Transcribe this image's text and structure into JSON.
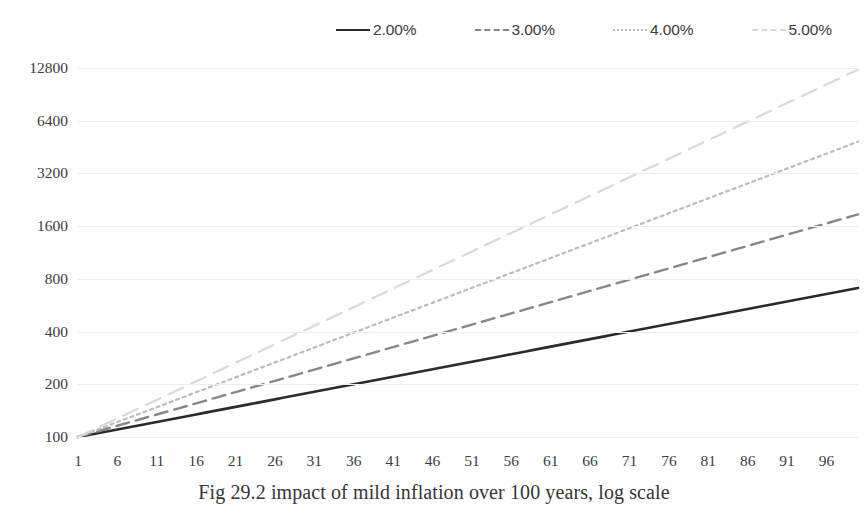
{
  "chart_data": {
    "type": "line",
    "title": "",
    "caption": "Fig 29.2 impact of mild inflation over 100 years, log scale",
    "xlabel": "",
    "ylabel": "",
    "log_scale": true,
    "log_base": 2,
    "grid": true,
    "legend_position": "top",
    "x_range": [
      1,
      100
    ],
    "ylim": [
      100,
      12800
    ],
    "y_ticks": [
      100,
      200,
      400,
      800,
      1600,
      3200,
      6400,
      12800
    ],
    "y_tick_labels": [
      "100",
      "200",
      "400",
      "800",
      "1600",
      "3200",
      "6400",
      "12800"
    ],
    "x_ticks": [
      1,
      6,
      11,
      16,
      21,
      26,
      31,
      36,
      41,
      46,
      51,
      56,
      61,
      66,
      71,
      76,
      81,
      86,
      91,
      96
    ],
    "x_tick_labels": [
      "1",
      "6",
      "11",
      "16",
      "21",
      "26",
      "31",
      "36",
      "41",
      "46",
      "51",
      "56",
      "61",
      "66",
      "71",
      "76",
      "81",
      "86",
      "91",
      "96"
    ],
    "series": [
      {
        "name": "2.00%",
        "label": "2.00%",
        "rate": 0.02,
        "base": 100,
        "color": "#2b2b2b",
        "width": 2.6,
        "dash": "none",
        "endpoint_value": 714,
        "values_at_ticks": [
          100,
          110,
          122,
          135,
          149,
          164,
          181,
          200,
          221,
          244,
          269,
          297,
          328,
          362,
          400,
          441,
          487,
          538,
          594,
          656
        ]
      },
      {
        "name": "3.00%",
        "label": "3.00%",
        "rate": 0.03,
        "base": 100,
        "color": "#878787",
        "width": 2.4,
        "dash": "dashed",
        "endpoint_value": 1893,
        "values_at_ticks": [
          100,
          116,
          134,
          155,
          180,
          209,
          242,
          281,
          326,
          378,
          438,
          508,
          589,
          683,
          792,
          918,
          1065,
          1234,
          1431,
          1659
        ]
      },
      {
        "name": "4.00%",
        "label": "4.00%",
        "rate": 0.04,
        "base": 100,
        "color": "#bcbcbc",
        "width": 2.2,
        "dash": "dotted",
        "endpoint_value": 4981,
        "values_at_ticks": [
          100,
          122,
          148,
          180,
          219,
          267,
          325,
          395,
          481,
          585,
          712,
          866,
          1054,
          1282,
          1560,
          1898,
          2310,
          2810,
          3419,
          4159
        ]
      },
      {
        "name": "5.00%",
        "label": "5.00%",
        "rate": 0.05,
        "base": 100,
        "color": "#d9d9d9",
        "width": 2.2,
        "dash": "dashed-light",
        "endpoint_value": 12891,
        "values_at_ticks": [
          100,
          128,
          163,
          208,
          265,
          339,
          432,
          552,
          704,
          898,
          1146,
          1463,
          1867,
          2383,
          3041,
          3882,
          4954,
          6323,
          8069,
          10298
        ]
      }
    ]
  }
}
